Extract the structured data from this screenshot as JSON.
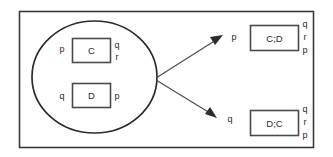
{
  "figure": {
    "title": "",
    "background_color": "#ffffff",
    "line_color": "#2b2b2b",
    "text_color": "#2b2b2b"
  },
  "group": {
    "name": "ellipse-group",
    "nodes": [
      {
        "id": "node-c",
        "label": "C",
        "left_labels": [
          "p"
        ],
        "right_labels": [
          "q",
          "r"
        ]
      },
      {
        "id": "node-d",
        "label": "D",
        "left_labels": [
          "q"
        ],
        "right_labels": [
          "p"
        ]
      }
    ]
  },
  "arrows": [
    {
      "id": "arrow-upper",
      "target_label": "p"
    },
    {
      "id": "arrow-lower",
      "target_label": "q"
    }
  ],
  "results": [
    {
      "id": "node-cd",
      "label": "C;D",
      "right_labels": [
        "q",
        "r",
        "p"
      ]
    },
    {
      "id": "node-dc",
      "label": "D;C",
      "right_labels": [
        "q",
        "r",
        "p"
      ]
    }
  ]
}
